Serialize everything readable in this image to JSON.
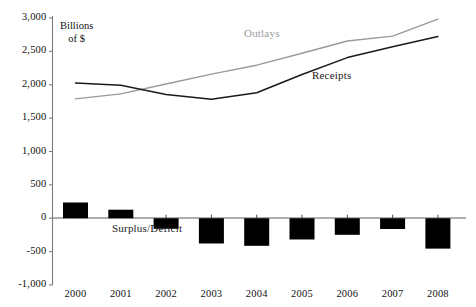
{
  "chart_data": {
    "type": "line",
    "title": "",
    "subtitle": "",
    "xlabel": "",
    "ylabel": "Billions of $",
    "ylabel_line1": "Billions",
    "ylabel_line2": "of $",
    "categories": [
      "2000",
      "2001",
      "2002",
      "2003",
      "2004",
      "2005",
      "2006",
      "2007",
      "2008"
    ],
    "x": [
      2000,
      2001,
      2002,
      2003,
      2004,
      2005,
      2006,
      2007,
      2008
    ],
    "ylim": [
      -1000,
      3000
    ],
    "ytick_values": [
      3000,
      2500,
      2000,
      1500,
      1000,
      500,
      0,
      -500,
      -1000
    ],
    "ytick_labels": [
      "3,000",
      "2,500",
      "2,000",
      "1,500",
      "1,000",
      "500",
      "0",
      "-500",
      "-1,000"
    ],
    "grid": false,
    "legend": "inline-annotations",
    "series": [
      {
        "name": "Outlays",
        "type": "line",
        "color": "#9a9a9a",
        "values": [
          1789,
          1863,
          2011,
          2160,
          2293,
          2472,
          2655,
          2729,
          2983
        ]
      },
      {
        "name": "Receipts",
        "type": "line",
        "color": "#1a1a1a",
        "values": [
          2025,
          1991,
          1853,
          1782,
          1880,
          2154,
          2407,
          2568,
          2724
        ]
      },
      {
        "name": "Surplus/Deficit",
        "type": "bar",
        "color": "#000000",
        "values": [
          236,
          128,
          -158,
          -378,
          -413,
          -318,
          -248,
          -161,
          -455
        ]
      }
    ],
    "annotations": [
      {
        "text": "Outlays",
        "series": "Outlays",
        "x_px": 244,
        "y_px": 34
      },
      {
        "text": "Receipts",
        "series": "Receipts",
        "x_px": 312,
        "y_px": 76
      },
      {
        "text": "Surplus/Deficit",
        "series": "Surplus/Deficit",
        "x_px": 112,
        "y_px": 229
      }
    ]
  },
  "axis": {
    "y_title_line1": "Billions",
    "y_title_line2": "of $",
    "y_labels": [
      "3,000",
      "2,500",
      "2,000",
      "1,500",
      "1,000",
      "500",
      "0",
      "-500",
      "-1,000"
    ],
    "x_labels": [
      "2000",
      "2001",
      "2002",
      "2003",
      "2004",
      "2005",
      "2006",
      "2007",
      "2008"
    ]
  },
  "labels": {
    "outlays": "Outlays",
    "receipts": "Receipts",
    "surplus_deficit": "Surplus/Deficit"
  },
  "colors": {
    "outlays_line": "#9a9a9a",
    "receipts_line": "#1a1a1a",
    "bar_fill": "#000000",
    "axis": "#808080",
    "text": "#111111",
    "background": "#ffffff"
  }
}
